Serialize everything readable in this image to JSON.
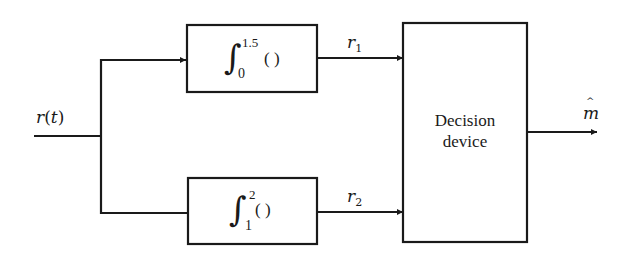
{
  "diagram": {
    "type": "block-diagram",
    "title": "",
    "input": {
      "label_var": "r",
      "label_arg": "t",
      "label": "r(t)"
    },
    "blocks": [
      {
        "id": "integrator-1",
        "kind": "integrator",
        "upper_limit": "1.5",
        "lower_limit": "0",
        "argument": "( )",
        "label": "∫₀^1.5 ( )"
      },
      {
        "id": "integrator-2",
        "kind": "integrator",
        "upper_limit": "2",
        "lower_limit": "1",
        "argument": "( )",
        "label": "∫₁^2 ( )"
      },
      {
        "id": "decision-device",
        "kind": "decision",
        "line1": "Decision",
        "line2": "device",
        "label": "Decision device"
      }
    ],
    "signals": [
      {
        "id": "r1",
        "var": "r",
        "sub": "1",
        "from": "integrator-1",
        "to": "decision-device"
      },
      {
        "id": "r2",
        "var": "r",
        "sub": "2",
        "from": "integrator-2",
        "to": "decision-device"
      }
    ],
    "output": {
      "var": "m",
      "accent": "^",
      "label": "m̂"
    },
    "colors": {
      "stroke": "#1a1a1a",
      "background": "#ffffff"
    }
  }
}
